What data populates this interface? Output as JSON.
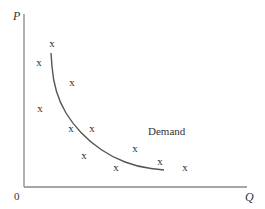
{
  "chart_data": {
    "type": "scatter",
    "title": "",
    "xlabel": "Q",
    "ylabel": "P",
    "origin_label": "0",
    "grid": false,
    "legend": null,
    "point_marker": "x",
    "annotations": [
      {
        "text": "Demand",
        "px": [
          148,
          135
        ]
      }
    ],
    "axis_px": {
      "x0": 24,
      "y0": 187,
      "xmax": 247,
      "ytop": 14
    },
    "points_px": [
      [
        52,
        43
      ],
      [
        39,
        62
      ],
      [
        72,
        82
      ],
      [
        40,
        108
      ],
      [
        71,
        128
      ],
      [
        92,
        128
      ],
      [
        84,
        155
      ],
      [
        116,
        167
      ],
      [
        135,
        148
      ],
      [
        160,
        161
      ],
      [
        185,
        167
      ]
    ],
    "series": [
      {
        "name": "Demand",
        "type": "line",
        "curve_px": [
          [
            51,
            53
          ],
          [
            53,
            80
          ],
          [
            60,
            103
          ],
          [
            72,
            123
          ],
          [
            90,
            142
          ],
          [
            112,
            157
          ],
          [
            138,
            167
          ],
          [
            164,
            170
          ]
        ]
      }
    ]
  },
  "labels": {
    "y_axis": "P",
    "x_axis": "Q",
    "origin": "0",
    "curve": "Demand",
    "marker": "x"
  },
  "colors": {
    "axis": "#888888",
    "curve": "#555555",
    "text": "#333333"
  }
}
